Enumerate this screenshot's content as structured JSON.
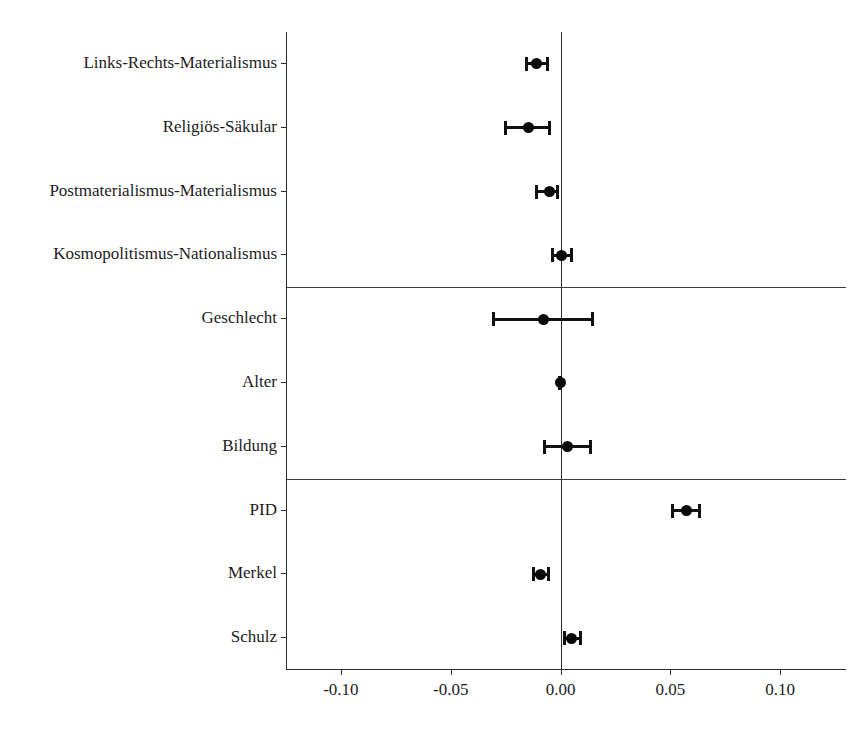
{
  "chart_data": {
    "type": "scatter",
    "subtype": "coefficient-plot",
    "title": "",
    "xlabel": "",
    "ylabel": "",
    "xlim": [
      -0.125,
      0.13
    ],
    "grid": false,
    "legend": false,
    "zero_reference_line": 0.0,
    "xticks": [
      -0.1,
      -0.05,
      0.0,
      0.05,
      0.1
    ],
    "xticklabels": [
      "-0.10",
      "-0.05",
      "0.00",
      "0.05",
      "0.10"
    ],
    "categories": [
      "Links-Rechts-Materialismus",
      "Religiös-Säkular",
      "Postmaterialismus-Materialismus",
      "Kosmopolitismus-Nationalismus",
      "Geschlecht",
      "Alter",
      "Bildung",
      "PID",
      "Merkel",
      "Schulz"
    ],
    "estimates": [
      -0.0111,
      -0.0144,
      -0.005,
      0.0004,
      -0.0077,
      -0.0002,
      0.0034,
      0.0575,
      -0.0092,
      0.0052
    ],
    "ci_low": [
      -0.0162,
      -0.0258,
      -0.0114,
      -0.0043,
      -0.031,
      -0.0012,
      -0.008,
      0.0505,
      -0.013,
      0.0012
    ],
    "ci_high": [
      -0.0051,
      -0.0044,
      -0.0006,
      0.0057,
      0.0152,
      0.0008,
      0.0145,
      0.0641,
      -0.005,
      0.01
    ],
    "group_separators_after": [
      3,
      6
    ],
    "point_color": "#090909",
    "line_color": "#111111",
    "axis_color": "#2b2b2b"
  },
  "caption": {
    "text": ""
  }
}
